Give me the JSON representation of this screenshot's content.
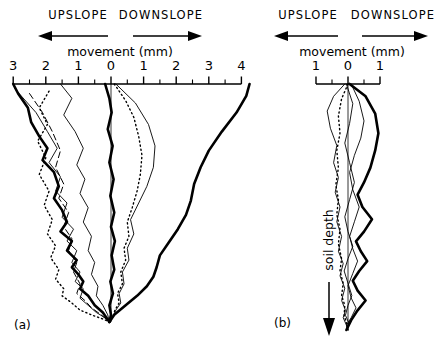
{
  "figure": {
    "caption_a": "(a)",
    "caption_b": "(b)",
    "depth_axis_label": "soil depth",
    "axis_title": "movement (mm)",
    "direction_left": "UPSLOPE",
    "direction_right": "DOWNSLOPE",
    "left_arrow_icon": "arrow-left-icon",
    "right_arrow_icon": "arrow-right-icon",
    "depth_arrow_icon": "arrow-down-icon",
    "ink": "#000000",
    "background": "#ffffff"
  },
  "chart_data": [
    {
      "id": "panel-a",
      "type": "line",
      "title": "(a)",
      "xlabel": "movement (mm)",
      "ylabel": "soil depth",
      "orientation": "vertical-depth",
      "grid": false,
      "legend": "none",
      "xlim": [
        -3,
        4.4
      ],
      "ylim": [
        0,
        1
      ],
      "xticks": [
        -3,
        -2,
        -1,
        0,
        1,
        2,
        3,
        4
      ],
      "xticklabels": [
        "3",
        "2",
        "1",
        "0",
        "1",
        "2",
        "3",
        "4"
      ],
      "minor_tick_step": 0.5,
      "axis_note": "negative x = UPSLOPE, positive x = DOWNSLOPE",
      "zero_reference_line": 0,
      "series": [
        {
          "name": "profile-1-thick-upslope",
          "style": "thick-solid",
          "x": [
            -3.0,
            -2.85,
            -2.55,
            -2.45,
            -2.2,
            -1.95,
            -2.1,
            -1.75,
            -1.6,
            -1.75,
            -1.5,
            -1.35,
            -1.55,
            -1.2,
            -1.35,
            -1.05,
            -1.2,
            -1.0,
            -0.85,
            -0.95,
            -0.7,
            -0.5,
            -0.25,
            -0.05
          ],
          "depth": [
            0.0,
            0.04,
            0.1,
            0.16,
            0.22,
            0.27,
            0.32,
            0.37,
            0.43,
            0.48,
            0.53,
            0.58,
            0.62,
            0.66,
            0.7,
            0.74,
            0.77,
            0.8,
            0.83,
            0.86,
            0.89,
            0.93,
            0.96,
            1.0
          ]
        },
        {
          "name": "profile-2-thin-upslope",
          "style": "thin-solid",
          "x": [
            -2.95,
            -2.3,
            -1.95,
            -1.65,
            -1.9,
            -1.55,
            -1.7,
            -1.35,
            -1.5,
            -1.15,
            -1.35,
            -1.05,
            -1.2,
            -0.95,
            -1.1,
            -0.85,
            -0.95,
            -0.7,
            -0.45,
            -0.15,
            -0.05
          ],
          "depth": [
            0.02,
            0.12,
            0.2,
            0.27,
            0.33,
            0.39,
            0.45,
            0.5,
            0.56,
            0.61,
            0.66,
            0.7,
            0.75,
            0.79,
            0.83,
            0.86,
            0.9,
            0.93,
            0.96,
            0.985,
            1.0
          ]
        },
        {
          "name": "profile-3-dashed",
          "style": "dashed",
          "x": [
            -2.5,
            -2.1,
            -1.8,
            -1.55,
            -1.7,
            -1.45,
            -1.6,
            -1.3,
            -1.45,
            -1.2,
            -1.3,
            -1.05,
            -1.15,
            -0.95,
            -1.05,
            -0.8,
            -0.6,
            -0.3,
            -0.05
          ],
          "depth": [
            0.04,
            0.12,
            0.2,
            0.28,
            0.35,
            0.42,
            0.48,
            0.54,
            0.6,
            0.65,
            0.7,
            0.75,
            0.79,
            0.84,
            0.88,
            0.91,
            0.94,
            0.97,
            1.0
          ]
        },
        {
          "name": "profile-4-dotted",
          "style": "dotted",
          "x": [
            -1.9,
            -2.2,
            -1.95,
            -2.25,
            -2.0,
            -2.2,
            -1.9,
            -2.05,
            -1.8,
            -1.95,
            -1.7,
            -1.85,
            -1.6,
            -1.7,
            -1.45,
            -1.5,
            -1.2,
            -0.95,
            -0.6,
            -0.2,
            -0.05
          ],
          "depth": [
            0.03,
            0.1,
            0.17,
            0.24,
            0.31,
            0.38,
            0.45,
            0.51,
            0.57,
            0.63,
            0.68,
            0.73,
            0.78,
            0.82,
            0.86,
            0.89,
            0.92,
            0.95,
            0.97,
            0.99,
            1.0
          ]
        },
        {
          "name": "profile-5-thin-mid",
          "style": "thin-solid",
          "x": [
            -1.55,
            -1.2,
            -1.45,
            -1.1,
            -0.85,
            -1.05,
            -0.8,
            -0.95,
            -0.7,
            -0.85,
            -0.6,
            -0.7,
            -0.5,
            -0.6,
            -0.4,
            -0.45,
            -0.25,
            -0.1,
            -0.05
          ],
          "depth": [
            0.0,
            0.06,
            0.13,
            0.2,
            0.27,
            0.34,
            0.4,
            0.46,
            0.52,
            0.58,
            0.64,
            0.7,
            0.75,
            0.8,
            0.85,
            0.89,
            0.93,
            0.97,
            1.0
          ]
        },
        {
          "name": "profile-6-thick-zero",
          "style": "thick-solid",
          "x": [
            -0.18,
            -0.05,
            0.02,
            -0.1,
            0.05,
            -0.05,
            0.08,
            -0.02,
            0.1,
            0.0,
            0.12,
            0.02,
            0.1,
            -0.02,
            0.06,
            -0.05,
            0.0,
            -0.05
          ],
          "depth": [
            0.0,
            0.06,
            0.12,
            0.19,
            0.26,
            0.33,
            0.4,
            0.47,
            0.54,
            0.6,
            0.66,
            0.72,
            0.78,
            0.83,
            0.88,
            0.93,
            0.97,
            1.0
          ]
        },
        {
          "name": "profile-7-dotted-right",
          "style": "dotted",
          "x": [
            0.1,
            0.45,
            0.7,
            0.85,
            0.95,
            0.9,
            0.8,
            0.65,
            0.5,
            0.55,
            0.4,
            0.45,
            0.3,
            0.35,
            0.2,
            0.25,
            0.12,
            0.05,
            -0.05
          ],
          "depth": [
            0.0,
            0.07,
            0.14,
            0.22,
            0.3,
            0.38,
            0.45,
            0.52,
            0.58,
            0.64,
            0.69,
            0.74,
            0.79,
            0.84,
            0.88,
            0.92,
            0.95,
            0.98,
            1.0
          ]
        },
        {
          "name": "profile-8-thin-right",
          "style": "thin-solid",
          "x": [
            0.15,
            0.75,
            1.15,
            1.35,
            1.3,
            1.1,
            0.85,
            0.6,
            0.7,
            0.5,
            0.55,
            0.35,
            0.4,
            0.25,
            0.3,
            0.15,
            0.05,
            -0.05
          ],
          "depth": [
            0.0,
            0.08,
            0.17,
            0.26,
            0.35,
            0.43,
            0.5,
            0.57,
            0.63,
            0.69,
            0.74,
            0.79,
            0.84,
            0.88,
            0.92,
            0.95,
            0.98,
            1.0
          ]
        },
        {
          "name": "profile-9-thick-downslope",
          "style": "thick-solid",
          "x": [
            4.25,
            4.15,
            3.85,
            3.4,
            3.0,
            2.75,
            2.55,
            2.45,
            2.3,
            2.05,
            1.75,
            1.5,
            1.4,
            1.3,
            1.1,
            0.8,
            0.45,
            0.1,
            -0.05
          ],
          "depth": [
            0.0,
            0.05,
            0.12,
            0.2,
            0.28,
            0.35,
            0.42,
            0.49,
            0.55,
            0.61,
            0.67,
            0.72,
            0.77,
            0.81,
            0.85,
            0.89,
            0.93,
            0.97,
            1.0
          ]
        }
      ]
    },
    {
      "id": "panel-b",
      "type": "line",
      "title": "(b)",
      "xlabel": "movement (mm)",
      "ylabel": "soil depth",
      "orientation": "vertical-depth",
      "grid": false,
      "legend": "none",
      "xlim": [
        -1.3,
        1.3
      ],
      "ylim": [
        0,
        1
      ],
      "xticks": [
        -1,
        0,
        1
      ],
      "xticklabels": [
        "1",
        "0",
        "1"
      ],
      "minor_tick_step": 0.5,
      "axis_note": "negative x = UPSLOPE, positive x = DOWNSLOPE",
      "zero_reference_line": 0,
      "series": [
        {
          "name": "profile-b1-thick",
          "style": "thick-solid",
          "x": [
            0.05,
            0.55,
            0.85,
            0.95,
            0.85,
            0.7,
            0.5,
            0.3,
            0.45,
            0.75,
            0.5,
            0.25,
            0.4,
            0.6,
            0.35,
            0.15,
            0.3,
            0.55,
            0.3,
            0.1,
            -0.05
          ],
          "depth": [
            0.0,
            0.05,
            0.12,
            0.2,
            0.27,
            0.34,
            0.4,
            0.45,
            0.5,
            0.55,
            0.6,
            0.64,
            0.68,
            0.72,
            0.76,
            0.8,
            0.84,
            0.88,
            0.92,
            0.96,
            1.0
          ]
        },
        {
          "name": "profile-b2-thin-left",
          "style": "thin-solid",
          "x": [
            -0.1,
            -0.45,
            -0.65,
            -0.55,
            -0.35,
            -0.45,
            -0.3,
            -0.4,
            -0.25,
            -0.35,
            -0.2,
            -0.3,
            -0.15,
            -0.25,
            -0.1,
            -0.2,
            -0.08,
            -0.15,
            -0.05,
            0.0
          ],
          "depth": [
            0.0,
            0.05,
            0.11,
            0.18,
            0.25,
            0.32,
            0.38,
            0.44,
            0.5,
            0.56,
            0.62,
            0.68,
            0.73,
            0.78,
            0.83,
            0.88,
            0.92,
            0.95,
            0.98,
            1.0
          ]
        },
        {
          "name": "profile-b3-dotted",
          "style": "dotted",
          "x": [
            0.0,
            -0.2,
            -0.3,
            -0.25,
            -0.35,
            -0.3,
            -0.38,
            -0.3,
            -0.35,
            -0.25,
            -0.3,
            -0.2,
            -0.25,
            -0.15,
            -0.2,
            -0.1,
            -0.12,
            -0.05,
            0.0
          ],
          "depth": [
            0.0,
            0.06,
            0.13,
            0.2,
            0.27,
            0.34,
            0.41,
            0.47,
            0.53,
            0.59,
            0.65,
            0.71,
            0.76,
            0.81,
            0.86,
            0.9,
            0.94,
            0.97,
            1.0
          ]
        },
        {
          "name": "profile-b4-thin-right",
          "style": "thin-solid",
          "x": [
            0.1,
            0.35,
            0.5,
            0.4,
            0.2,
            0.05,
            0.15,
            0.35,
            0.2,
            0.05,
            0.15,
            0.3,
            0.15,
            0.0,
            0.1,
            0.25,
            0.1,
            -0.05,
            0.0
          ],
          "depth": [
            0.0,
            0.07,
            0.15,
            0.22,
            0.29,
            0.36,
            0.43,
            0.5,
            0.56,
            0.62,
            0.67,
            0.72,
            0.77,
            0.82,
            0.87,
            0.91,
            0.95,
            0.98,
            1.0
          ]
        },
        {
          "name": "profile-b5-thin-mid",
          "style": "thin-solid",
          "x": [
            -0.05,
            0.15,
            0.05,
            -0.1,
            0.05,
            0.2,
            0.05,
            -0.1,
            0.0,
            0.15,
            0.0,
            -0.12,
            0.0,
            0.12,
            0.0,
            -0.08,
            0.02,
            -0.02,
            0.0
          ],
          "depth": [
            0.0,
            0.08,
            0.16,
            0.24,
            0.32,
            0.4,
            0.47,
            0.54,
            0.6,
            0.66,
            0.71,
            0.76,
            0.81,
            0.86,
            0.9,
            0.94,
            0.97,
            0.99,
            1.0
          ]
        }
      ]
    }
  ]
}
